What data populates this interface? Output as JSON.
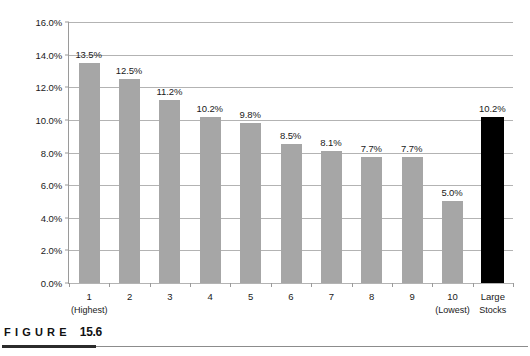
{
  "chart_data": {
    "type": "bar",
    "title": "",
    "xlabel": "",
    "ylabel": "",
    "ylim": [
      0,
      16
    ],
    "ytick_step": 2,
    "grid": true,
    "legend": "none",
    "yticks": [
      "0.0%",
      "2.0%",
      "4.0%",
      "6.0%",
      "8.0%",
      "10.0%",
      "12.0%",
      "14.0%",
      "16.0%"
    ],
    "ytick_values": [
      0,
      2,
      4,
      6,
      8,
      10,
      12,
      14,
      16
    ],
    "categories": [
      "1",
      "2",
      "3",
      "4",
      "5",
      "6",
      "7",
      "8",
      "9",
      "10",
      "Large Stocks"
    ],
    "category_sublabels": [
      "(Highest)",
      "",
      "",
      "",
      "",
      "",
      "",
      "",
      "",
      "(Lowest)",
      ""
    ],
    "values": [
      13.5,
      12.5,
      11.2,
      10.2,
      9.8,
      8.5,
      8.1,
      7.7,
      7.7,
      5.0,
      10.2
    ],
    "value_labels": [
      "13.5%",
      "12.5%",
      "11.2%",
      "10.2%",
      "9.8%",
      "8.5%",
      "8.1%",
      "7.7%",
      "7.7%",
      "5.0%",
      "10.2%"
    ],
    "bar_colors": [
      "#a6a6a6",
      "#a6a6a6",
      "#a6a6a6",
      "#a6a6a6",
      "#a6a6a6",
      "#a6a6a6",
      "#a6a6a6",
      "#a6a6a6",
      "#a6a6a6",
      "#a6a6a6",
      "#000000"
    ],
    "colors": {
      "bar_gray": "#a6a6a6",
      "bar_black": "#000000",
      "gridline": "#b3b3b3",
      "axis": "#9a9a9a",
      "text": "#1a1a1a"
    }
  },
  "caption": {
    "word": "FIGURE",
    "number": "15.6"
  }
}
